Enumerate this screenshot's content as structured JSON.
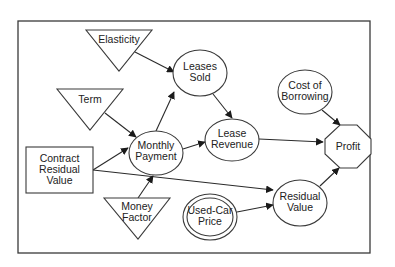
{
  "diagram": {
    "type": "influence-diagram",
    "nodes": {
      "elasticity": {
        "shape": "inverted-triangle",
        "lines": [
          "Elasticity"
        ]
      },
      "term": {
        "shape": "inverted-triangle",
        "lines": [
          "Term"
        ]
      },
      "contract_residual_value": {
        "shape": "rectangle",
        "lines": [
          "Contract",
          "Residual",
          "Value"
        ]
      },
      "money_factor": {
        "shape": "inverted-triangle",
        "lines": [
          "Money",
          "Factor"
        ]
      },
      "leases_sold": {
        "shape": "ellipse",
        "lines": [
          "Leases",
          "Sold"
        ]
      },
      "monthly_payment": {
        "shape": "ellipse",
        "lines": [
          "Monthly",
          "Payment"
        ]
      },
      "lease_revenue": {
        "shape": "ellipse",
        "lines": [
          "Lease",
          "Revenue"
        ]
      },
      "cost_of_borrowing": {
        "shape": "ellipse",
        "lines": [
          "Cost of",
          "Borrowing"
        ]
      },
      "profit": {
        "shape": "octagon",
        "lines": [
          "Profit"
        ]
      },
      "residual_value": {
        "shape": "ellipse",
        "lines": [
          "Residual",
          "Value"
        ]
      },
      "used_car_price": {
        "shape": "double-ellipse",
        "lines": [
          "Used-Car",
          "Price"
        ]
      }
    },
    "edges": [
      {
        "from": "Elasticity",
        "to": "Leases Sold"
      },
      {
        "from": "Term",
        "to": "Monthly Payment"
      },
      {
        "from": "Contract Residual Value",
        "to": "Monthly Payment"
      },
      {
        "from": "Contract Residual Value",
        "to": "Residual Value"
      },
      {
        "from": "Money Factor",
        "to": "Monthly Payment"
      },
      {
        "from": "Monthly Payment",
        "to": "Leases Sold"
      },
      {
        "from": "Monthly Payment",
        "to": "Lease Revenue"
      },
      {
        "from": "Leases Sold",
        "to": "Lease Revenue"
      },
      {
        "from": "Lease Revenue",
        "to": "Profit"
      },
      {
        "from": "Cost of Borrowing",
        "to": "Profit"
      },
      {
        "from": "Residual Value",
        "to": "Profit"
      },
      {
        "from": "Used-Car Price",
        "to": "Residual Value"
      }
    ]
  }
}
